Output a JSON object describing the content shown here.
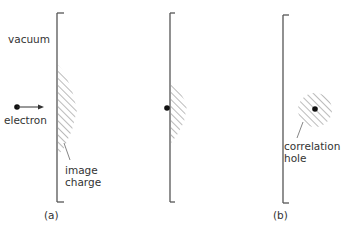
{
  "panel_a": {
    "label": "(a)",
    "vacuum_label": "vacuum",
    "electron_label": "electron",
    "image_charge_label_line1": "image",
    "image_charge_label_line2": "charge"
  },
  "panel_middle": {},
  "panel_b": {
    "label": "(b)",
    "correlation_hole_label_line1": "correlation",
    "correlation_hole_label_line2": "hole"
  },
  "colors": {
    "line": "#555555",
    "hatch": "#777777",
    "dot": "#111111",
    "text": "#333333"
  }
}
